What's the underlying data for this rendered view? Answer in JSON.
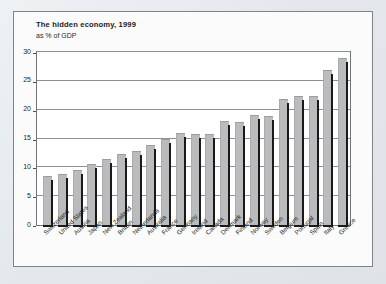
{
  "chart_data": {
    "type": "bar",
    "title": "The hidden economy, 1999",
    "subtitle": "as % of GDP",
    "xlabel": "",
    "ylabel": "",
    "ylim": [
      0,
      30
    ],
    "yticks": [
      0,
      5,
      10,
      15,
      20,
      25,
      30
    ],
    "ytick_labels": [
      "0",
      "5",
      "10",
      "15",
      "20",
      "25",
      "30"
    ],
    "grid": true,
    "legend": "none",
    "bar_color": "#b9bbbd",
    "frame_color": "#6f7478",
    "background_color": "#ffffff",
    "categories": [
      "Switzerland",
      "United States",
      "Austria",
      "Japan",
      "New Zealand",
      "Britain",
      "Netherlands",
      "Australia",
      "France",
      "Germany",
      "Ireland",
      "Canada",
      "Denmark",
      "Finland",
      "Norway",
      "Sweden",
      "Belgium",
      "Portugal",
      "Spain",
      "Italy",
      "Greece"
    ],
    "values": [
      8.5,
      8.8,
      9.6,
      10.6,
      11.4,
      12.3,
      12.8,
      13.8,
      15.0,
      15.9,
      15.7,
      15.7,
      18.0,
      17.9,
      19.1,
      18.9,
      21.8,
      22.4,
      22.4,
      26.8,
      29.0
    ]
  }
}
